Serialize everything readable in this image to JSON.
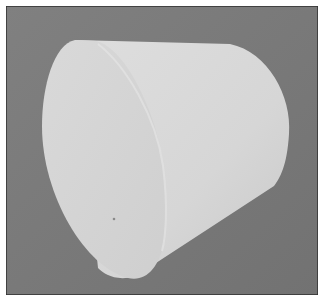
{
  "image": {
    "subject": "white truncated cone (frustum) photographed on gray background",
    "background_color": "#7c7c7c",
    "border_color": "#2f2f2f",
    "object_color_light": "#dcdcdc",
    "object_color_face": "#d2d2d2",
    "object_color_side": "#cfcfcf"
  }
}
